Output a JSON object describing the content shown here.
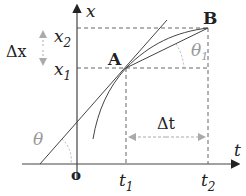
{
  "diagram": {
    "axes": {
      "x_axis_label": "t",
      "y_axis_label": "x",
      "origin_label": "o"
    },
    "points": [
      {
        "name": "A",
        "label": "A"
      },
      {
        "name": "B",
        "label": "B"
      }
    ],
    "ticks": {
      "t1": {
        "base": "t",
        "sub": "1"
      },
      "t2": {
        "base": "t",
        "sub": "2"
      },
      "x1": {
        "base": "x",
        "sub": "1"
      },
      "x2": {
        "base": "x",
        "sub": "2"
      }
    },
    "intervals": {
      "delta_x": "Δx",
      "delta_t": "Δt"
    },
    "angles": {
      "theta": "θ",
      "theta1": {
        "base": "θ",
        "sub": "1"
      }
    },
    "colors": {
      "line": "#333333",
      "dashed": "#555555",
      "annotation": "#999999"
    }
  }
}
